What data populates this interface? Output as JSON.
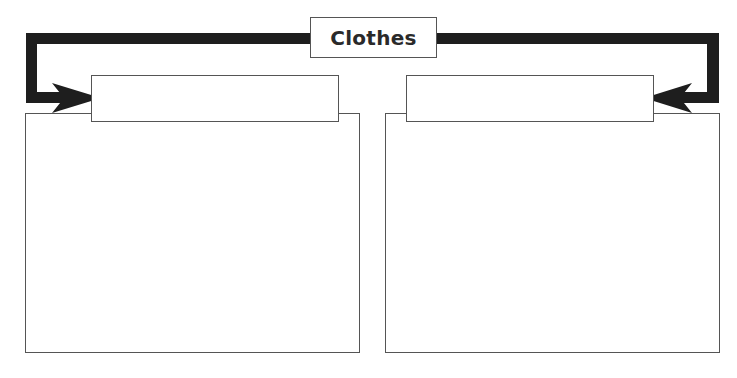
{
  "diagram": {
    "title": "Clothes",
    "connector_color": "#1e1e1e",
    "border_color": "#555555",
    "left_branch": {
      "label": "",
      "content": ""
    },
    "right_branch": {
      "label": "",
      "content": ""
    },
    "footer_text": ""
  }
}
